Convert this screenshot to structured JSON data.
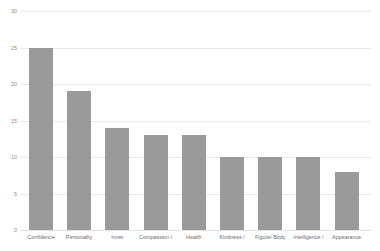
{
  "chart_data": {
    "type": "bar",
    "title": "",
    "xlabel": "",
    "ylabel": "",
    "ylim": [
      0,
      30
    ],
    "yticks": [
      30,
      25,
      20,
      15,
      10,
      5,
      0
    ],
    "ytick_labels": [
      "30",
      "25",
      "20",
      "15",
      "10",
      "5",
      "0"
    ],
    "grid": "horizontal",
    "legend": "none",
    "bar_color": "#9a9a9a",
    "gridline_color": "#e9e9e9",
    "categories": [
      "Confidence",
      "Personality",
      "Inner",
      "Compassion /",
      "Health",
      "Kindness /",
      "Figure/ Body",
      "Intelligence /",
      "Appearance"
    ],
    "values": [
      25,
      19,
      14,
      13,
      13,
      10,
      10,
      10,
      8
    ]
  }
}
